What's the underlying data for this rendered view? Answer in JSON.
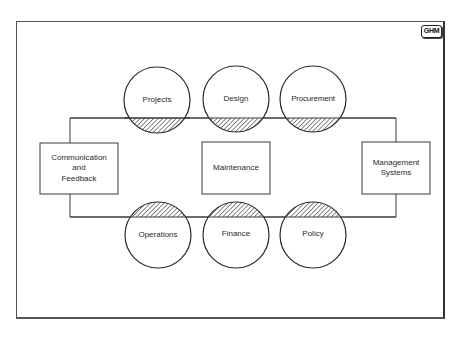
{
  "diagram": {
    "badge": "GHM",
    "center": {
      "id": "maintenance",
      "label": "Maintenance"
    },
    "side_boxes": [
      {
        "id": "communication",
        "label_lines": [
          "Communication",
          "and",
          "Feedback"
        ]
      },
      {
        "id": "management",
        "label_lines": [
          "Management",
          "Systems"
        ]
      }
    ],
    "top_circles": [
      {
        "id": "projects",
        "label": "Projects"
      },
      {
        "id": "design",
        "label": "Design"
      },
      {
        "id": "procurement",
        "label": "Procurement"
      }
    ],
    "bottom_circles": [
      {
        "id": "operations",
        "label": "Operations"
      },
      {
        "id": "finance",
        "label": "Finance"
      },
      {
        "id": "policy",
        "label": "Policy"
      }
    ],
    "style": {
      "line_color": "#2a2a2a",
      "hatch_pattern": "diagonal",
      "hatched_part_top_circles": "lower segment (inside loop)",
      "hatched_part_bottom_circles": "upper segment (inside loop)"
    }
  }
}
